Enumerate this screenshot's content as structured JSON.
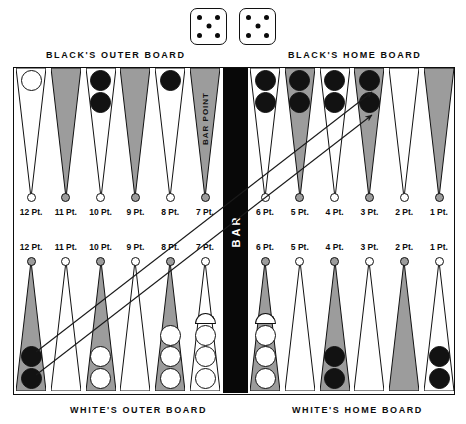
{
  "dice": {
    "name": "dice-pair",
    "values": [
      5,
      5
    ],
    "pip_layout": [
      "top-left",
      "top-right",
      "center",
      "bottom-left",
      "bottom-right"
    ]
  },
  "captions": {
    "black_outer": "BLACK'S OUTER BOARD",
    "black_home": "BLACK'S HOME BOARD",
    "white_outer": "WHITE'S OUTER BOARD",
    "white_home": "WHITE'S HOME BOARD"
  },
  "bar": {
    "label": "BAR",
    "point_label": "BAR POINT"
  },
  "colors": {
    "point_dark": "#9c9c9c",
    "point_light": "#ffffff",
    "checker_black": "#121212",
    "checker_white": "#ffffff",
    "bar_fill": "#080808",
    "outline": "#111111"
  },
  "board": {
    "top_left": {
      "quadrant": "black-outer-board",
      "points": [
        {
          "label": "12 Pt.",
          "shade": "light",
          "checkers": 1,
          "color": "white"
        },
        {
          "label": "11 Pt.",
          "shade": "dark",
          "checkers": 0,
          "color": ""
        },
        {
          "label": "10 Pt.",
          "shade": "light",
          "checkers": 2,
          "color": "black"
        },
        {
          "label": "9 Pt.",
          "shade": "dark",
          "checkers": 0,
          "color": ""
        },
        {
          "label": "8 Pt.",
          "shade": "light",
          "checkers": 1,
          "color": "black"
        },
        {
          "label": "7 Pt.",
          "shade": "dark",
          "checkers": 0,
          "color": ""
        }
      ]
    },
    "top_right": {
      "quadrant": "black-home-board",
      "points": [
        {
          "label": "6 Pt.",
          "shade": "light",
          "checkers": 2,
          "color": "black"
        },
        {
          "label": "5 Pt.",
          "shade": "dark",
          "checkers": 2,
          "color": "black"
        },
        {
          "label": "4 Pt.",
          "shade": "light",
          "checkers": 2,
          "color": "black"
        },
        {
          "label": "3 Pt.",
          "shade": "dark",
          "checkers": 2,
          "color": "black"
        },
        {
          "label": "2 Pt.",
          "shade": "light",
          "checkers": 0,
          "color": ""
        },
        {
          "label": "1 Pt.",
          "shade": "dark",
          "checkers": 0,
          "color": ""
        }
      ]
    },
    "bottom_left": {
      "quadrant": "white-outer-board",
      "points": [
        {
          "label": "12 Pt.",
          "shade": "dark",
          "checkers": 2,
          "color": "black"
        },
        {
          "label": "11 Pt.",
          "shade": "light",
          "checkers": 0,
          "color": ""
        },
        {
          "label": "10 Pt.",
          "shade": "dark",
          "checkers": 2,
          "color": "white"
        },
        {
          "label": "9 Pt.",
          "shade": "light",
          "checkers": 0,
          "color": ""
        },
        {
          "label": "8 Pt.",
          "shade": "dark",
          "checkers": 3,
          "color": "white"
        },
        {
          "label": "7 Pt.",
          "shade": "light",
          "checkers": 4,
          "color": "white"
        }
      ]
    },
    "bottom_right": {
      "quadrant": "white-home-board",
      "points": [
        {
          "label": "6 Pt.",
          "shade": "dark",
          "checkers": 4,
          "color": "white"
        },
        {
          "label": "5 Pt.",
          "shade": "light",
          "checkers": 0,
          "color": ""
        },
        {
          "label": "4 Pt.",
          "shade": "dark",
          "checkers": 2,
          "color": "black"
        },
        {
          "label": "3 Pt.",
          "shade": "light",
          "checkers": 0,
          "color": ""
        },
        {
          "label": "2 Pt.",
          "shade": "dark",
          "checkers": 0,
          "color": ""
        },
        {
          "label": "1 Pt.",
          "shade": "light",
          "checkers": 2,
          "color": "black"
        }
      ]
    }
  },
  "move_arrows": [
    {
      "from": "bottom 12 Pt.",
      "to": "top 3 Pt.",
      "x1": 36,
      "y1": 352,
      "x2": 372,
      "y2": 92
    },
    {
      "from": "bottom 12 Pt.",
      "to": "top 3 Pt.",
      "x1": 36,
      "y1": 375,
      "x2": 372,
      "y2": 115
    }
  ]
}
